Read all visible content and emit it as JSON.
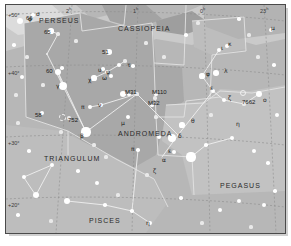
{
  "chart_data": {
    "type": "scatter",
    "xlabel": "Right Ascension",
    "ylabel": "Declination",
    "xlim": [
      "2h40m",
      "22h40m"
    ],
    "ylim": [
      15,
      55
    ],
    "grid": true,
    "legend_position": "none",
    "ra_ticks": [
      {
        "label": "2",
        "unit": "h",
        "x": 60
      },
      {
        "label": "1",
        "unit": "h",
        "x": 127
      },
      {
        "label": "0",
        "unit": "h",
        "x": 194
      },
      {
        "label": "23",
        "unit": "h",
        "x": 254
      }
    ],
    "dec_ticks": [
      {
        "label": "+50°",
        "y": 8
      },
      {
        "label": "+40°",
        "y": 66
      },
      {
        "label": "+30°",
        "y": 136
      },
      {
        "label": "+20°",
        "y": 198
      }
    ],
    "constellations": [
      {
        "name": "PERSEUS",
        "x": 33,
        "y": 12
      },
      {
        "name": "CASSIOPEIA",
        "x": 112,
        "y": 20
      },
      {
        "name": "ANDROMEDA",
        "x": 112,
        "y": 125
      },
      {
        "name": "TRIANGULUM",
        "x": 38,
        "y": 150
      },
      {
        "name": "PISCES",
        "x": 83,
        "y": 212
      },
      {
        "name": "PEGASUS",
        "x": 214,
        "y": 177
      }
    ],
    "deep_sky_objects": [
      {
        "name": "M31",
        "x": 119,
        "y": 84,
        "type": "galaxy"
      },
      {
        "name": "M110",
        "x": 146,
        "y": 84,
        "type": "galaxy"
      },
      {
        "name": "M32",
        "x": 142,
        "y": 95,
        "type": "galaxy"
      },
      {
        "name": "752",
        "x": 62,
        "y": 112,
        "type": "open-cluster"
      },
      {
        "name": "7662",
        "x": 236,
        "y": 94,
        "type": "planetary-nebula"
      }
    ],
    "flamsteed_stars": [
      {
        "name": "65",
        "x": 38,
        "y": 24
      },
      {
        "name": "51",
        "x": 96,
        "y": 44
      },
      {
        "name": "60",
        "x": 40,
        "y": 63
      },
      {
        "name": "58",
        "x": 29,
        "y": 107
      },
      {
        "name": "66",
        "x": 20,
        "y": 10
      }
    ],
    "greek_stars": [
      {
        "name": "σ",
        "x": 30,
        "y": 6
      },
      {
        "name": "φ",
        "x": 22,
        "y": 11
      },
      {
        "name": "χ",
        "x": 82,
        "y": 72
      },
      {
        "name": "ψ",
        "x": 100,
        "y": 64
      },
      {
        "name": "ω",
        "x": 96,
        "y": 70
      },
      {
        "name": "υ",
        "x": 92,
        "y": 62
      },
      {
        "name": "τ",
        "x": 121,
        "y": 57
      },
      {
        "name": "γ",
        "x": 50,
        "y": 78
      },
      {
        "name": "π",
        "x": 75,
        "y": 99
      },
      {
        "name": "ν",
        "x": 92,
        "y": 97
      },
      {
        "name": "β",
        "x": 74,
        "y": 128
      },
      {
        "name": "μ",
        "x": 115,
        "y": 115
      },
      {
        "name": "π",
        "x": 125,
        "y": 141
      },
      {
        "name": "φ",
        "x": 200,
        "y": 66
      },
      {
        "name": "λ",
        "x": 218,
        "y": 63
      },
      {
        "name": "ι",
        "x": 215,
        "y": 40
      },
      {
        "name": "κ",
        "x": 222,
        "y": 36
      },
      {
        "name": "ε",
        "x": 204,
        "y": 80
      },
      {
        "name": "ζ",
        "x": 222,
        "y": 90
      },
      {
        "name": "ο",
        "x": 257,
        "y": 92
      },
      {
        "name": "θ",
        "x": 185,
        "y": 113
      },
      {
        "name": "δ",
        "x": 172,
        "y": 128
      },
      {
        "name": "ε",
        "x": 162,
        "y": 143
      },
      {
        "name": "α",
        "x": 156,
        "y": 152
      },
      {
        "name": "ζ",
        "x": 147,
        "y": 163
      },
      {
        "name": "η",
        "x": 230,
        "y": 116
      },
      {
        "name": "η",
        "x": 140,
        "y": 215
      },
      {
        "name": "μ",
        "x": 265,
        "y": 20
      }
    ],
    "stars": [
      {
        "x": 14,
        "y": 16,
        "m": 3.2
      },
      {
        "x": 27,
        "y": 10,
        "m": 2.4
      },
      {
        "x": 45,
        "y": 26,
        "m": 2.6
      },
      {
        "x": 52,
        "y": 29,
        "m": 1.6
      },
      {
        "x": 8,
        "y": 40,
        "m": 1.8
      },
      {
        "x": 21,
        "y": 52,
        "m": 1.6
      },
      {
        "x": 41,
        "y": 49,
        "m": 1.4
      },
      {
        "x": 56,
        "y": 63,
        "m": 1.8
      },
      {
        "x": 52,
        "y": 67,
        "m": 3.0
      },
      {
        "x": 37,
        "y": 80,
        "m": 1.6
      },
      {
        "x": 57,
        "y": 81,
        "m": 4.2
      },
      {
        "x": 16,
        "y": 72,
        "m": 2.0
      },
      {
        "x": 10,
        "y": 90,
        "m": 1.6
      },
      {
        "x": 36,
        "y": 108,
        "m": 2.4
      },
      {
        "x": 63,
        "y": 113,
        "m": 1.6
      },
      {
        "x": 84,
        "y": 102,
        "m": 2.2
      },
      {
        "x": 88,
        "y": 73,
        "m": 2.6
      },
      {
        "x": 101,
        "y": 67,
        "m": 2.0
      },
      {
        "x": 105,
        "y": 71,
        "m": 2.2
      },
      {
        "x": 97,
        "y": 64,
        "m": 1.8
      },
      {
        "x": 103,
        "y": 47,
        "m": 2.8
      },
      {
        "x": 113,
        "y": 60,
        "m": 2.4
      },
      {
        "x": 119,
        "y": 56,
        "m": 1.6
      },
      {
        "x": 127,
        "y": 61,
        "m": 1.8
      },
      {
        "x": 95,
        "y": 100,
        "m": 2.0
      },
      {
        "x": 80,
        "y": 127,
        "m": 4.6
      },
      {
        "x": 117,
        "y": 89,
        "m": 3.2
      },
      {
        "x": 131,
        "y": 89,
        "m": 1.6
      },
      {
        "x": 149,
        "y": 93,
        "m": 1.6
      },
      {
        "x": 122,
        "y": 112,
        "m": 2.4
      },
      {
        "x": 132,
        "y": 145,
        "m": 1.8
      },
      {
        "x": 153,
        "y": 132,
        "m": 2.0
      },
      {
        "x": 166,
        "y": 133,
        "m": 4.4
      },
      {
        "x": 176,
        "y": 120,
        "m": 2.6
      },
      {
        "x": 168,
        "y": 147,
        "m": 2.0
      },
      {
        "x": 185,
        "y": 152,
        "m": 4.6
      },
      {
        "x": 196,
        "y": 71,
        "m": 2.6
      },
      {
        "x": 210,
        "y": 68,
        "m": 2.8
      },
      {
        "x": 213,
        "y": 45,
        "m": 2.4
      },
      {
        "x": 221,
        "y": 41,
        "m": 2.2
      },
      {
        "x": 207,
        "y": 86,
        "m": 2.2
      },
      {
        "x": 218,
        "y": 95,
        "m": 2.0
      },
      {
        "x": 253,
        "y": 89,
        "m": 3.0
      },
      {
        "x": 238,
        "y": 99,
        "m": 1.6
      },
      {
        "x": 265,
        "y": 25,
        "m": 2.0
      },
      {
        "x": 243,
        "y": 30,
        "m": 1.6
      },
      {
        "x": 268,
        "y": 60,
        "m": 1.8
      },
      {
        "x": 271,
        "y": 110,
        "m": 2.2
      },
      {
        "x": 200,
        "y": 140,
        "m": 1.8
      },
      {
        "x": 226,
        "y": 133,
        "m": 2.2
      },
      {
        "x": 248,
        "y": 146,
        "m": 2.0
      },
      {
        "x": 262,
        "y": 158,
        "m": 1.8
      },
      {
        "x": 233,
        "y": 196,
        "m": 2.4
      },
      {
        "x": 214,
        "y": 205,
        "m": 2.0
      },
      {
        "x": 258,
        "y": 200,
        "m": 2.2
      },
      {
        "x": 269,
        "y": 186,
        "m": 1.8
      },
      {
        "x": 144,
        "y": 218,
        "m": 2.0
      },
      {
        "x": 99,
        "y": 200,
        "m": 1.8
      },
      {
        "x": 61,
        "y": 196,
        "m": 3.2
      },
      {
        "x": 30,
        "y": 190,
        "m": 3.4
      },
      {
        "x": 18,
        "y": 172,
        "m": 2.0
      },
      {
        "x": 46,
        "y": 160,
        "m": 2.2
      },
      {
        "x": 72,
        "y": 166,
        "m": 1.8
      },
      {
        "x": 91,
        "y": 178,
        "m": 2.0
      },
      {
        "x": 112,
        "y": 190,
        "m": 1.6
      },
      {
        "x": 126,
        "y": 206,
        "m": 1.8
      },
      {
        "x": 23,
        "y": 146,
        "m": 1.8
      },
      {
        "x": 100,
        "y": 152,
        "m": 1.6
      },
      {
        "x": 141,
        "y": 170,
        "m": 1.6
      },
      {
        "x": 175,
        "y": 193,
        "m": 1.8
      },
      {
        "x": 70,
        "y": 36,
        "m": 1.6
      },
      {
        "x": 140,
        "y": 38,
        "m": 1.6
      },
      {
        "x": 158,
        "y": 52,
        "m": 1.6
      },
      {
        "x": 180,
        "y": 30,
        "m": 1.8
      },
      {
        "x": 192,
        "y": 18,
        "m": 1.6
      },
      {
        "x": 233,
        "y": 14,
        "m": 1.8
      },
      {
        "x": 252,
        "y": 52,
        "m": 1.6
      },
      {
        "x": 205,
        "y": 110,
        "m": 1.6
      },
      {
        "x": 150,
        "y": 112,
        "m": 1.6
      },
      {
        "x": 88,
        "y": 140,
        "m": 1.6
      },
      {
        "x": 55,
        "y": 127,
        "m": 1.6
      },
      {
        "x": 12,
        "y": 118,
        "m": 1.6
      },
      {
        "x": 12,
        "y": 210,
        "m": 1.8
      },
      {
        "x": 45,
        "y": 216,
        "m": 1.6
      },
      {
        "x": 196,
        "y": 218,
        "m": 1.6
      },
      {
        "x": 245,
        "y": 222,
        "m": 1.6
      }
    ]
  }
}
